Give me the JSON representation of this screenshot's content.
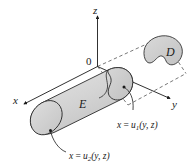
{
  "figure": {
    "type": "3d-solid-region-diagram",
    "background_color": "#ffffff",
    "axes": {
      "z_label": "z",
      "y_label": "y",
      "x_label": "x",
      "origin_label": "0"
    },
    "regions": {
      "solid_label": "E",
      "projection_label": "D"
    },
    "surface_labels": {
      "front": {
        "lhs": "x",
        "equals": "=",
        "func": "u",
        "subscript": "1",
        "args": "(y, z)",
        "full": "x = u1(y, z)"
      },
      "back": {
        "lhs": "x",
        "equals": "=",
        "func": "u",
        "subscript": "2",
        "args": "(y, z)",
        "full": "x = u2(y, z)"
      }
    },
    "colors": {
      "stroke": "#1a1a1a",
      "fill_light": "#d8d8d8",
      "fill_mid": "#cfcfcf",
      "fill_dark": "#bdbdbd",
      "fill_cap": "#d2d2d2",
      "dashed": "#555555"
    }
  }
}
